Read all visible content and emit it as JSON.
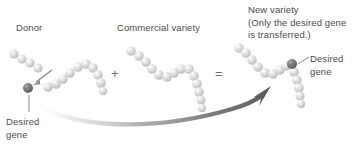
{
  "diagram": {
    "title_visible": false,
    "background_color": "#ffffff",
    "text_color": "#4b4b4b",
    "bead_light_color": "#d8d8d8",
    "bead_dark_color": "#6d6d6d",
    "arrow_color": "#6f6f6f"
  },
  "labels": {
    "donor": "Donor",
    "commercial_variety": "Commercial variety",
    "new_variety": "New variety\n(Only the desired gene\nis transferred.)",
    "desired_gene_left": "Desired\ngene",
    "desired_gene_right": "Desired\ngene"
  },
  "operators": {
    "plus": "+",
    "equals": "="
  },
  "chain_data": {
    "donor_fragment": {
      "name": "donor-fragment-chain",
      "bead_count": 4,
      "points": [
        [
          14,
          54
        ],
        [
          22,
          59
        ],
        [
          30,
          63
        ],
        [
          38,
          68
        ]
      ]
    },
    "donor_chromosome": {
      "name": "donor-chromosome-chain",
      "bead_count": 10,
      "points": [
        [
          48,
          85
        ],
        [
          56,
          83
        ],
        [
          63,
          78
        ],
        [
          70,
          72
        ],
        [
          77,
          66
        ],
        [
          84,
          62
        ],
        [
          91,
          65
        ],
        [
          96,
          72
        ],
        [
          100,
          79
        ],
        [
          103,
          86
        ]
      ]
    },
    "commercial_chromosome": {
      "name": "commercial-chromosome-chain",
      "bead_count": 14,
      "points": [
        [
          131,
          51
        ],
        [
          139,
          56
        ],
        [
          146,
          61
        ],
        [
          152,
          68
        ],
        [
          158,
          75
        ],
        [
          165,
          78
        ],
        [
          172,
          74
        ],
        [
          179,
          70
        ],
        [
          186,
          70
        ],
        [
          192,
          76
        ],
        [
          196,
          84
        ],
        [
          199,
          92
        ],
        [
          201,
          100
        ],
        [
          203,
          108
        ]
      ]
    },
    "new_variety_chromosome": {
      "name": "new-variety-chromosome-chain",
      "bead_count": 14,
      "points": [
        [
          239,
          48
        ],
        [
          246,
          53
        ],
        [
          252,
          59
        ],
        [
          257,
          66
        ],
        [
          263,
          72
        ],
        [
          270,
          74
        ],
        [
          276,
          70
        ],
        [
          282,
          66
        ],
        [
          289,
          65
        ],
        [
          294,
          70
        ],
        [
          296,
          79
        ],
        [
          298,
          88
        ],
        [
          299,
          97
        ],
        [
          300,
          106
        ]
      ]
    },
    "desired_gene_marker_left": {
      "name": "desired-gene-bead-left",
      "x": 28,
      "y": 88,
      "dark": true
    },
    "desired_gene_marker_right": {
      "name": "desired-gene-bead-right",
      "x": 289,
      "y": 65,
      "dark": true
    }
  },
  "arrows": {
    "extraction_arrow": {
      "name": "extraction-arrow",
      "from": [
        52,
        70
      ],
      "to": [
        33,
        84
      ]
    },
    "transfer_arrow": {
      "name": "gene-transfer-arrow",
      "description": "large curved arrow from donor gene to new variety"
    }
  },
  "leader_lines": {
    "left": {
      "from": [
        29,
        96
      ],
      "to": [
        29,
        112
      ]
    },
    "right": {
      "from": [
        296,
        66
      ],
      "to": [
        309,
        57
      ]
    }
  }
}
